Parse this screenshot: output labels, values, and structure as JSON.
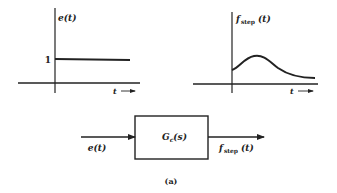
{
  "figure": {
    "caption": "(a)"
  },
  "input_plot": {
    "y_label": "e(t)",
    "x_label": "t",
    "level_tick_label": "1",
    "description": "unit step input"
  },
  "output_plot": {
    "y_label_main": "f",
    "y_label_sub": "step",
    "y_label_arg": "(t)",
    "x_label": "t",
    "description": "step response rising from initial value to a peak then decaying toward a lower steady value"
  },
  "block_diagram": {
    "input_label": "e(t)",
    "block_label_main": "G",
    "block_label_sub": "c",
    "block_label_arg": "(s)",
    "output_label_main": "f",
    "output_label_sub": "step",
    "output_label_arg": "(t)"
  }
}
